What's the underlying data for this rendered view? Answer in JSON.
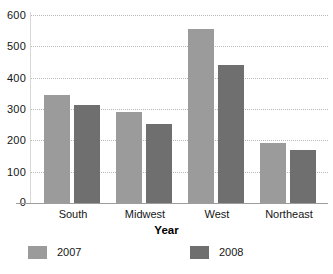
{
  "chart_data": {
    "type": "bar",
    "title": "",
    "subtitle": "",
    "xlabel": "Year",
    "ylabel": "",
    "categories": [
      "South",
      "Midwest",
      "West",
      "Northeast"
    ],
    "series": [
      {
        "name": "2007",
        "color": "#9b9b9b",
        "values": [
          345,
          292,
          555,
          192
        ]
      },
      {
        "name": "2008",
        "color": "#6f6f6f",
        "values": [
          313,
          251,
          440,
          170
        ]
      }
    ],
    "ylim": [
      0,
      600
    ],
    "yticks": [
      0,
      100,
      200,
      300,
      400,
      500,
      600
    ],
    "ytick_labels": [
      "0",
      "100",
      "200",
      "300",
      "400",
      "500",
      "600"
    ],
    "grid": "horizontal-dotted",
    "legend_position": "bottom",
    "legend": [
      "2007",
      "2008"
    ]
  },
  "colors": {
    "background": "#ffffff",
    "text": "#161616",
    "gridline": "#b8b8b8",
    "axis": "#9d9d9d",
    "series_2007": "#9b9b9b",
    "series_2008": "#6f6f6f"
  }
}
